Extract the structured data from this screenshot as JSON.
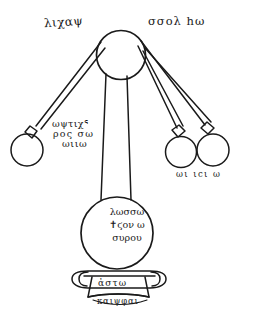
{
  "figure": {
    "medium": "hand-drawn ink line drawing",
    "ink_color": "#1a1a1a",
    "background_color": "#ffffff"
  },
  "labels": {
    "top_left": "λιχαψ",
    "top_right": "σσολ hω",
    "mid_left": {
      "line1": "ωψτιχᕐ",
      "line2": "ρος σω",
      "line3": "ωιιω"
    },
    "bottom_right": "ωι ιcι ω",
    "flask": {
      "line1": "λωσσω",
      "line2": "✝ϛον ω",
      "line3": "συρου"
    },
    "base": "ἀστω",
    "base_sub": "καιψφαι"
  },
  "parts": {
    "upper_sphere": "upper-sphere",
    "left_receiver": "left-receiver-sphere",
    "center_right_receiver": "center-right-receiver-sphere",
    "right_receiver": "right-receiver-sphere",
    "lower_flask": "lower-flask-sphere",
    "pedestal": "pedestal-base",
    "tubes": [
      "left-tube",
      "right-inner-tube",
      "right-outer-tube",
      "center-column"
    ]
  }
}
